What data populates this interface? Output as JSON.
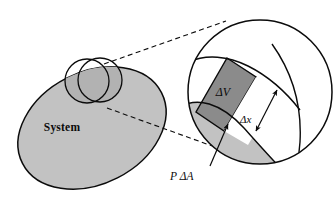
{
  "figure": {
    "background_color": "#ffffff",
    "ink_color": "#0b0b0b",
    "fill_light_gray": "#c2c2c2",
    "fill_dark_gray": "#8b8b8b",
    "fill_white": "#ffffff"
  },
  "labels": {
    "system": "System",
    "delta_v": "ΔV",
    "delta_x": "Δx",
    "p_delta_a": "P ΔA"
  },
  "shapes": {
    "system_blob": {
      "name": "system-blob",
      "fill": "#c2c2c2",
      "stroke": "#0b0b0b",
      "description": "large tilted gray ellipse labeled System"
    },
    "detail_circle_small": {
      "name": "detail-circle-small",
      "fill": "none",
      "stroke": "#0b0b0b",
      "cx": 87,
      "cy": 81,
      "r": 22,
      "description": "small callout circle on system boundary"
    },
    "detail_circle_large": {
      "name": "detail-circle-large",
      "fill": "#ffffff",
      "stroke": "#0b0b0b",
      "cx": 260,
      "cy": 92,
      "r": 72,
      "description": "magnified view circle"
    },
    "magnified_system_region": {
      "name": "magnified-system-region",
      "fill": "#c2c2c2",
      "description": "light gray system matter inside magnified circle, below original boundary"
    },
    "delta_v_slab": {
      "name": "delta-v-slab",
      "fill": "#8b8b8b",
      "stroke": "#0b0b0b",
      "description": "dark gray parallelogram slab of differential volume"
    },
    "swept_white_strip": {
      "name": "swept-white-strip",
      "fill": "#ffffff",
      "description": "white strip of width delta x between slab and displaced boundary"
    }
  },
  "leaders": {
    "dashed_upper": {
      "name": "leader-dashed-upper",
      "style": "dashed",
      "from": [
        104,
        64
      ],
      "to": [
        225,
        22
      ]
    },
    "dashed_lower": {
      "name": "leader-dashed-lower",
      "style": "dashed",
      "from": [
        106,
        108
      ],
      "to": [
        214,
        146
      ]
    },
    "pda_arrow": {
      "name": "pressure-force-arrow",
      "style": "solid-arrow",
      "from": [
        211,
        165
      ],
      "to": [
        227,
        126
      ]
    },
    "dx_arrow": {
      "name": "delta-x-dimension-arrow",
      "style": "double-headed-arrow",
      "from": [
        258,
        129
      ],
      "to": [
        276,
        91
      ]
    }
  }
}
